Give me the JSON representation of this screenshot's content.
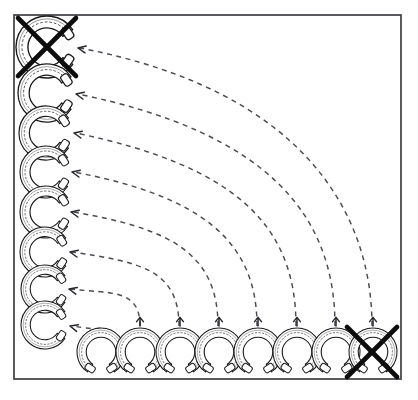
{
  "figure": {
    "background_color": "#ffffff",
    "frame": {
      "x": 14,
      "y": 15,
      "width": 387,
      "height": 364,
      "stroke_color": "#3f3f44",
      "stroke_width": 1.7
    },
    "colors": {
      "outline": "#1a1a1a",
      "nail_holes": "#3a3a3a",
      "dashed_arrow": "#4a4a52",
      "arrow_head": "#26262c",
      "cross_out": "#0d0d0d",
      "shoe_fill": "#ffffff"
    }
  },
  "left_column": {
    "label": "left-column-horseshoes",
    "orientation": "opening-right",
    "count": 8,
    "items": [
      {
        "id": "left-shoe-1",
        "cx": 47,
        "cy": 47,
        "size": 31,
        "crossed_out": true,
        "rotation": -90
      },
      {
        "id": "left-shoe-2",
        "cx": 47,
        "cy": 93,
        "size": 29,
        "crossed_out": false,
        "rotation": -90
      },
      {
        "id": "left-shoe-3",
        "cx": 46,
        "cy": 133,
        "size": 27,
        "crossed_out": false,
        "rotation": -90
      },
      {
        "id": "left-shoe-4",
        "cx": 46,
        "cy": 172,
        "size": 26,
        "crossed_out": false,
        "rotation": -90
      },
      {
        "id": "left-shoe-5",
        "cx": 46,
        "cy": 212,
        "size": 26,
        "crossed_out": false,
        "rotation": -90
      },
      {
        "id": "left-shoe-6",
        "cx": 45,
        "cy": 252,
        "size": 25,
        "crossed_out": false,
        "rotation": -90
      },
      {
        "id": "left-shoe-7",
        "cx": 45,
        "cy": 289,
        "size": 24,
        "crossed_out": false,
        "rotation": -90
      },
      {
        "id": "left-shoe-8",
        "cx": 45,
        "cy": 325,
        "size": 24,
        "crossed_out": false,
        "rotation": -90
      }
    ]
  },
  "bottom_row": {
    "label": "bottom-row-horseshoes",
    "orientation": "opening-down",
    "count": 8,
    "items": [
      {
        "id": "bottom-shoe-1",
        "cx": 101,
        "cy": 352,
        "size": 24,
        "crossed_out": false,
        "rotation": 0
      },
      {
        "id": "bottom-shoe-2",
        "cx": 140,
        "cy": 352,
        "size": 24,
        "crossed_out": false,
        "rotation": 0
      },
      {
        "id": "bottom-shoe-3",
        "cx": 180,
        "cy": 352,
        "size": 24,
        "crossed_out": false,
        "rotation": 0
      },
      {
        "id": "bottom-shoe-4",
        "cx": 219,
        "cy": 352,
        "size": 24,
        "crossed_out": false,
        "rotation": 0
      },
      {
        "id": "bottom-shoe-5",
        "cx": 258,
        "cy": 352,
        "size": 24,
        "crossed_out": false,
        "rotation": 0
      },
      {
        "id": "bottom-shoe-6",
        "cx": 297,
        "cy": 352,
        "size": 24,
        "crossed_out": false,
        "rotation": 0
      },
      {
        "id": "bottom-shoe-7",
        "cx": 336,
        "cy": 352,
        "size": 24,
        "crossed_out": false,
        "rotation": 0
      },
      {
        "id": "bottom-shoe-8",
        "cx": 373,
        "cy": 352,
        "size": 24,
        "crossed_out": true,
        "rotation": 0
      }
    ]
  },
  "connectors": {
    "label": "dashed-curved-arrows",
    "count": 8,
    "style": "dashed",
    "arrow_direction": "bottom-to-left",
    "paths": [
      {
        "id": "arc-1",
        "from": "bottom-shoe-8",
        "to": "left-shoe-1",
        "d": "M 372 326 C 372 210 300 90 80 48",
        "tip_x": 78,
        "tip_y": 48,
        "tip_angle": 190
      },
      {
        "id": "arc-2",
        "from": "bottom-shoe-7",
        "to": "left-shoe-2",
        "d": "M 335 326 C 335 215 268 133 78 94",
        "tip_x": 76,
        "tip_y": 94,
        "tip_angle": 192
      },
      {
        "id": "arc-3",
        "from": "bottom-shoe-6",
        "to": "left-shoe-3",
        "d": "M 296 326 C 296 224 234 166 76 133",
        "tip_x": 74,
        "tip_y": 133,
        "tip_angle": 192
      },
      {
        "id": "arc-4",
        "from": "bottom-shoe-5",
        "to": "left-shoe-4",
        "d": "M 257 326 C 257 240 200 196 74 172",
        "tip_x": 72,
        "tip_y": 172,
        "tip_angle": 192
      },
      {
        "id": "arc-5",
        "from": "bottom-shoe-4",
        "to": "left-shoe-5",
        "d": "M 218 326 C 218 252 168 228 73 212",
        "tip_x": 71,
        "tip_y": 212,
        "tip_angle": 192
      },
      {
        "id": "arc-6",
        "from": "bottom-shoe-3",
        "to": "left-shoe-6",
        "d": "M 179 326 C 179 268 137 262 72 252",
        "tip_x": 70,
        "tip_y": 252,
        "tip_angle": 192
      },
      {
        "id": "arc-7",
        "from": "bottom-shoe-2",
        "to": "left-shoe-7",
        "d": "M 140 326 C 140 288 110 294 71 289",
        "tip_x": 69,
        "tip_y": 289,
        "tip_angle": 193
      },
      {
        "id": "arc-8",
        "from": "bottom-shoe-1",
        "to": "left-shoe-8",
        "d": "M 100 328 C 96 330 86 328 72 326",
        "tip_x": 70,
        "tip_y": 326,
        "tip_angle": 195
      }
    ]
  },
  "cross_marks": {
    "label": "crossed-out-markers",
    "count": 2,
    "items": [
      {
        "id": "cross-top-left",
        "cx": 47,
        "cy": 47,
        "radius": 29,
        "target": "left-shoe-1"
      },
      {
        "id": "cross-bottom-right",
        "cx": 372,
        "cy": 352,
        "radius": 25,
        "target": "bottom-shoe-8"
      }
    ]
  }
}
